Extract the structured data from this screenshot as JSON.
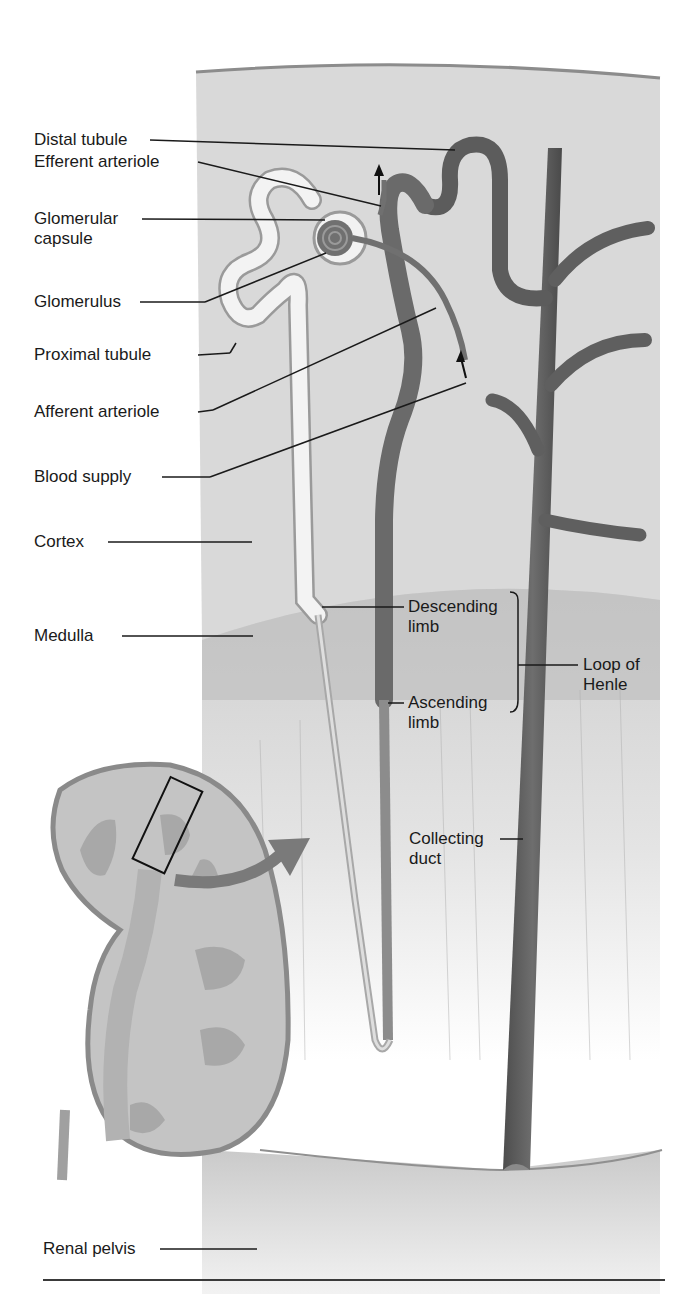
{
  "diagram": {
    "colors": {
      "cortex": "#d9d9d9",
      "medulla": "#bdbdbd",
      "vessel_dark": "#5e5e5e",
      "tubule_light": "#f1f1f1",
      "label_line": "#1a1a1a",
      "kidney_fill": "#c4c4c4",
      "kidney_outline": "#8a8a8a"
    },
    "labels": {
      "distal_tubule": "Distal tubule",
      "efferent_arteriole": "Efferent arteriole",
      "glomerular_capsule_1": "Glomerular",
      "glomerular_capsule_2": "capsule",
      "glomerulus": "Glomerulus",
      "proximal_tubule": "Proximal tubule",
      "afferent_arteriole": "Afferent arteriole",
      "blood_supply": "Blood supply",
      "cortex": "Cortex",
      "medulla": "Medulla",
      "descending_limb_1": "Descending",
      "descending_limb_2": "limb",
      "ascending_limb_1": "Ascending",
      "ascending_limb_2": "limb",
      "loop_of_henle_1": "Loop of",
      "loop_of_henle_2": "Henle",
      "collecting_duct_1": "Collecting",
      "collecting_duct_2": "duct",
      "renal_pelvis": "Renal pelvis"
    },
    "icons": [
      "blood-flow-arrow-up",
      "blood-flow-arrow-in",
      "magnify-arrow",
      "inset-box"
    ]
  }
}
